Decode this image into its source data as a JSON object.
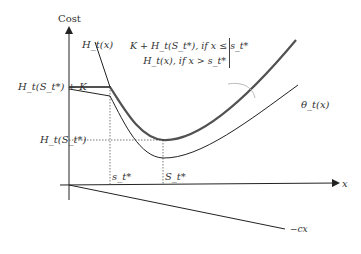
{
  "diagram": {
    "type": "inventory-cost-function",
    "y_axis_label": "Cost",
    "x_axis_label": "x",
    "labels": {
      "H_curve": "H_t(x)",
      "theta_curve": "θ_t(x)",
      "neg_cx_line": "−cx",
      "level_high": "H_t(S_t*) + K",
      "level_low": "H_t(S_t*)",
      "s_small": "s_t*",
      "S_big": "S_t*"
    },
    "piecewise": {
      "row1": "K + H_t(S_t*), if x ≤ s_t*",
      "row2": "H_t(x), if x > s_t*"
    },
    "colors": {
      "axis": "#222222",
      "curve_thick": "#333333",
      "curve_thin": "#222222",
      "guide_dotted": "#555555",
      "callout": "#bbbbbb"
    }
  }
}
